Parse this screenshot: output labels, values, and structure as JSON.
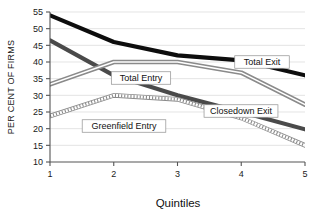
{
  "chart_data": {
    "type": "line",
    "title": "",
    "xlabel": "Quintiles",
    "ylabel": "PER CENT OF FIRMS",
    "categories": [
      "1",
      "2",
      "3",
      "4",
      "5"
    ],
    "x": [
      1,
      2,
      3,
      4,
      5
    ],
    "xlim": [
      1,
      5
    ],
    "ylim": [
      10,
      55
    ],
    "yticks": [
      10,
      15,
      20,
      25,
      30,
      35,
      40,
      45,
      50,
      55
    ],
    "ytick_labels": [
      "10",
      "15",
      "20",
      "25",
      "30",
      "35",
      "40",
      "45",
      "50",
      "55"
    ],
    "xticks": [
      1,
      2,
      3,
      4,
      5
    ],
    "xtick_labels": [
      "1",
      "2",
      "3",
      "4",
      "5"
    ],
    "grid": true,
    "grid_axis": "y",
    "legend": "inline-annotations",
    "series": [
      {
        "name": "Total Exit",
        "values": [
          54.0,
          46.0,
          42.0,
          40.5,
          36.0
        ],
        "color": "#0d0d0d",
        "style": "thick-solid",
        "label_x": 262,
        "label_y": 62
      },
      {
        "name": "Closedown Exit",
        "values": [
          46.5,
          36.0,
          30.0,
          25.0,
          19.8
        ],
        "color": "#4a4a4a",
        "style": "thick-solid",
        "label_x": 241,
        "label_y": 111
      },
      {
        "name": "Total Entry",
        "values": [
          33.3,
          40.0,
          40.0,
          36.8,
          27.2
        ],
        "color": "#b4b4b4",
        "style": "double-line",
        "label_x": 141,
        "label_y": 78
      },
      {
        "name": "Greenfield Entry",
        "values": [
          23.8,
          30.0,
          28.8,
          23.2,
          15.0
        ],
        "color": "#bdbdbd",
        "style": "beaded-line",
        "label_x": 124,
        "label_y": 126
      }
    ],
    "annotations": [
      {
        "text": "Total Exit",
        "boxed": true
      },
      {
        "text": "Closedown Exit",
        "boxed": true
      },
      {
        "text": "Total Entry",
        "boxed": true
      },
      {
        "text": "Greenfield Entry",
        "boxed": true
      }
    ]
  },
  "axes": {
    "y_title": "PER CENT OF FIRMS",
    "x_title": "Quintiles"
  }
}
